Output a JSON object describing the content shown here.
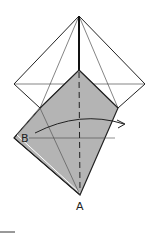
{
  "diagram": {
    "type": "origami-fold-step",
    "labels": {
      "point_a": "A",
      "point_b": "B"
    },
    "colors": {
      "paper_back": "#ffffff",
      "paper_front": "#b4b4b4",
      "line": "#222222"
    },
    "annotations": [
      "valley fold line (dashed)",
      "fold arrow from B to right"
    ]
  }
}
